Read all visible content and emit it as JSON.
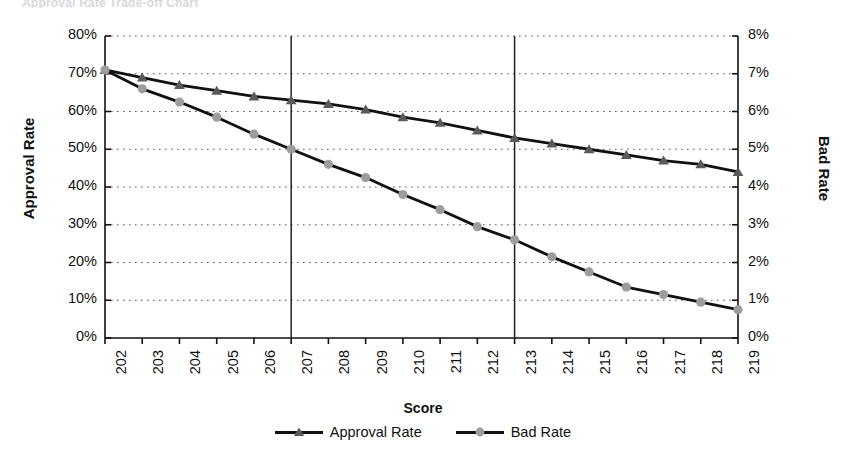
{
  "title": "Approval Rate  Trade-off Chart",
  "axes": {
    "x_title": "Score",
    "y_left_title": "Approval Rate",
    "y_right_title": "Bad Rate"
  },
  "legend": [
    {
      "label": "Approval Rate",
      "marker": "triangle-marker",
      "color": "#5a5a5a"
    },
    {
      "label": "Bad Rate",
      "marker": "circle-marker",
      "color": "#9d9d9d"
    }
  ],
  "colors": {
    "line": "#111111",
    "approval_marker": "#5a5a5a",
    "bad_marker": "#9d9d9d",
    "grid": "#555555",
    "axis": "#111111",
    "reference_line": "#222222"
  },
  "chart_data": {
    "type": "line",
    "title": "Approval Rate  Trade-off Chart",
    "xlabel": "Score",
    "ylabel": "Approval Rate",
    "y2label": "Bad Rate",
    "x": [
      202,
      203,
      204,
      205,
      206,
      207,
      208,
      209,
      210,
      211,
      212,
      213,
      214,
      215,
      216,
      217,
      218,
      219
    ],
    "xtick_labels": [
      "202",
      "203",
      "204",
      "205",
      "206",
      "207",
      "208",
      "209",
      "210",
      "211",
      "212",
      "213",
      "214",
      "215",
      "216",
      "217",
      "218",
      "219"
    ],
    "xlim": [
      202,
      219
    ],
    "ylim": [
      0,
      80
    ],
    "y2lim": [
      0,
      8
    ],
    "ytick_labels": [
      "0%",
      "10%",
      "20%",
      "30%",
      "40%",
      "50%",
      "60%",
      "70%",
      "80%"
    ],
    "ytick_values": [
      0,
      10,
      20,
      30,
      40,
      50,
      60,
      70,
      80
    ],
    "y2tick_labels": [
      "0%",
      "1%",
      "2%",
      "3%",
      "4%",
      "5%",
      "6%",
      "7%",
      "8%"
    ],
    "y2tick_values": [
      0,
      1,
      2,
      3,
      4,
      5,
      6,
      7,
      8
    ],
    "grid": "horizontal-dotted",
    "legend_position": "bottom-center",
    "series": [
      {
        "name": "Approval Rate",
        "axis": "left",
        "marker": "triangle",
        "values": [
          71.0,
          69.0,
          67.0,
          65.5,
          64.0,
          63.0,
          62.0,
          60.5,
          58.5,
          57.0,
          55.0,
          53.0,
          51.5,
          50.0,
          48.5,
          47.0,
          46.0,
          44.0
        ]
      },
      {
        "name": "Bad Rate",
        "axis": "right",
        "marker": "circle",
        "values": [
          7.1,
          6.6,
          6.25,
          5.85,
          5.4,
          5.0,
          4.6,
          4.25,
          3.8,
          3.4,
          2.95,
          2.6,
          2.15,
          1.75,
          1.35,
          1.15,
          0.95,
          0.75
        ]
      }
    ],
    "reference_lines": [
      {
        "name": "reference-line-207",
        "x": 207,
        "orientation": "vertical"
      },
      {
        "name": "reference-line-213",
        "x": 213,
        "orientation": "vertical"
      }
    ]
  }
}
